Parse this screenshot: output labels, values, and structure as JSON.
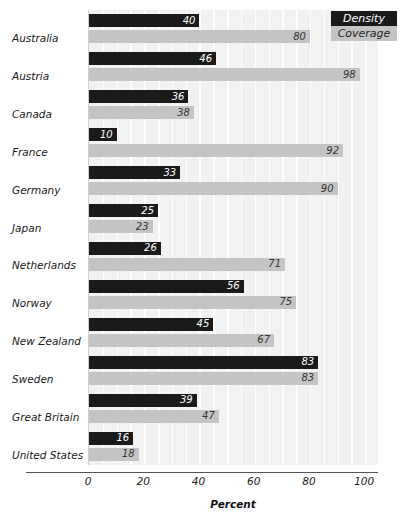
{
  "chart_data": {
    "type": "bar",
    "orientation": "horizontal",
    "title": "",
    "xlabel": "Percent",
    "ylabel": "",
    "xlim": [
      0,
      105
    ],
    "xticks": [
      0,
      20,
      40,
      60,
      80,
      100
    ],
    "grid": true,
    "legend_position": "top-right",
    "categories": [
      "Australia",
      "Austria",
      "Canada",
      "France",
      "Germany",
      "Japan",
      "Netherlands",
      "Norway",
      "New Zealand",
      "Sweden",
      "Great Britain",
      "United States"
    ],
    "series": [
      {
        "name": "Density",
        "color": "#1a1a1a",
        "values": [
          40,
          46,
          36,
          10,
          33,
          25,
          26,
          56,
          45,
          83,
          39,
          16
        ]
      },
      {
        "name": "Coverage",
        "color": "#c4c4c4",
        "values": [
          80,
          98,
          38,
          92,
          90,
          23,
          71,
          75,
          67,
          83,
          47,
          18
        ]
      }
    ]
  },
  "legend": {
    "items": [
      {
        "label": "Density",
        "color": "#1a1a1a"
      },
      {
        "label": "Coverage",
        "color": "#c4c4c4"
      }
    ]
  },
  "axis": {
    "title": "Percent",
    "tick_labels": [
      "0",
      "20",
      "40",
      "60",
      "80",
      "100"
    ]
  },
  "colors": {
    "density_bar": "#1a1a1a",
    "coverage_bar": "#c4c4c4",
    "plot_background": "#f2f2f2",
    "grid_line": "#ffffff",
    "axis_line": "#555555",
    "text": "#1a1a1a"
  }
}
